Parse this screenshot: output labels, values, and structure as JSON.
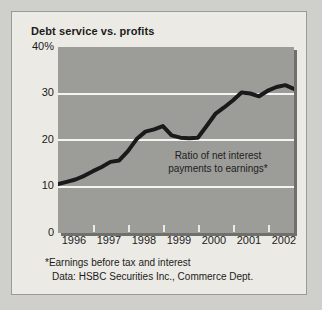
{
  "chart_data": {
    "type": "line",
    "title": "Debt service vs. profits",
    "xlabel": "",
    "ylabel": "",
    "ylim": [
      0,
      40
    ],
    "xlim": [
      1996,
      2002.75
    ],
    "grid": true,
    "grid_values": [
      10,
      20,
      30
    ],
    "legend": "none",
    "annotation": {
      "line1": "Ratio of net interest",
      "line2": "payments to earnings*"
    },
    "ytick_labels": [
      "40%",
      "30",
      "20",
      "10",
      "0"
    ],
    "ytick_values": [
      40,
      30,
      20,
      10,
      0
    ],
    "xtick_labels": [
      "1996",
      "1997",
      "1998",
      "1999",
      "2000",
      "2001",
      "2002"
    ],
    "xtick_values": [
      1996,
      1997,
      1998,
      1999,
      2000,
      2001,
      2002
    ],
    "series": [
      {
        "name": "Ratio of net interest payments to earnings",
        "color": "#1a1a1a",
        "x": [
          1996.0,
          1996.25,
          1996.5,
          1996.75,
          1997.0,
          1997.25,
          1997.5,
          1997.75,
          1998.0,
          1998.25,
          1998.5,
          1998.75,
          1999.0,
          1999.25,
          1999.5,
          1999.75,
          2000.0,
          2000.25,
          2000.5,
          2000.75,
          2001.0,
          2001.25,
          2001.5,
          2001.75,
          2002.0,
          2002.25,
          2002.5,
          2002.75
        ],
        "values": [
          10.5,
          11.0,
          11.5,
          12.3,
          13.3,
          14.2,
          15.3,
          15.6,
          17.6,
          20.2,
          21.8,
          22.3,
          23.0,
          21.0,
          20.5,
          20.4,
          20.5,
          23.0,
          25.6,
          27.0,
          28.5,
          30.2,
          30.0,
          29.4,
          30.6,
          31.4,
          31.8,
          31.0
        ]
      }
    ],
    "footnotes": [
      "*Earnings before tax and interest",
      "Data: HSBC Securities Inc., Commerce Dept."
    ],
    "colors": {
      "plot_background": "#9c9c99",
      "figure_background": "#eceae5",
      "gridline": "#f4f4f0",
      "line": "#1a1a1a",
      "page_background": "#cfcfcb"
    }
  }
}
